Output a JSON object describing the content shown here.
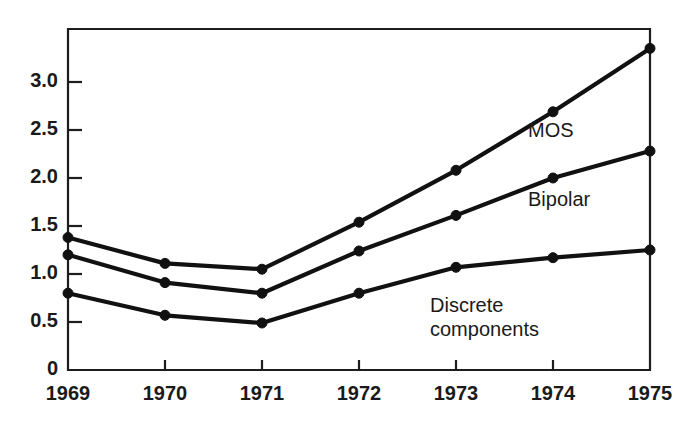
{
  "chart_data": {
    "type": "line",
    "title": "",
    "subtitle": "",
    "xlabel": "",
    "ylabel": "",
    "categories": [
      "1969",
      "1970",
      "1971",
      "1972",
      "1973",
      "1974",
      "1975"
    ],
    "x": [
      1969,
      1970,
      1971,
      1972,
      1973,
      1974,
      1975
    ],
    "xlim": [
      1969,
      1975
    ],
    "ylim": [
      0,
      3.55
    ],
    "yticks": [
      0,
      0.5,
      1.0,
      1.5,
      2.0,
      2.5,
      3.0
    ],
    "ytick_labels": [
      "0",
      "0.5",
      "1.0",
      "1.5",
      "2.0",
      "2.5",
      "3.0"
    ],
    "grid": false,
    "legend_position": "inline-right",
    "series": [
      {
        "name": "MOS",
        "label": "MOS",
        "values": [
          1.38,
          1.11,
          1.05,
          1.54,
          2.08,
          2.69,
          3.35
        ],
        "color": "#111111"
      },
      {
        "name": "Bipolar",
        "label": "Bipolar",
        "values": [
          1.2,
          0.91,
          0.8,
          1.24,
          1.61,
          2.0,
          2.28
        ],
        "color": "#111111"
      },
      {
        "name": "Discrete components",
        "label": "Discrete\ncomponents",
        "label_line1": "Discrete",
        "label_line2": "components",
        "values": [
          0.8,
          0.57,
          0.49,
          0.8,
          1.07,
          1.17,
          1.25
        ],
        "color": "#111111"
      }
    ],
    "annotations": [
      {
        "text": "MOS",
        "x": 1973.6,
        "y": 2.42
      },
      {
        "text": "Bipolar",
        "x": 1973.6,
        "y": 1.72
      },
      {
        "text": "Discrete",
        "x": 1972.6,
        "y": 0.72
      },
      {
        "text": "components",
        "x": 1972.6,
        "y": 0.55
      }
    ]
  },
  "axes": {
    "y_tick_labels": [
      "3.0",
      "2.5",
      "2.0",
      "1.5",
      "1.0",
      "0.5",
      "0"
    ],
    "x_tick_labels": [
      "1969",
      "1970",
      "1971",
      "1972",
      "1973",
      "1974",
      "1975"
    ]
  },
  "labels": {
    "mos": "MOS",
    "bipolar": "Bipolar",
    "discrete_line1": "Discrete",
    "discrete_line2": "components"
  },
  "colors": {
    "line": "#111111",
    "axis": "#1d1d1d",
    "background": "#ffffff",
    "text": "#1a1a1a"
  }
}
